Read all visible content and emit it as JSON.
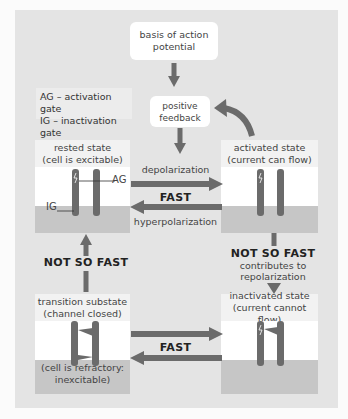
{
  "diagram": {
    "title_box": {
      "line1": "basis of action",
      "line2": "potential"
    },
    "legend": {
      "ag": "AG – activation gate",
      "ig": "IG – inactivation gate"
    },
    "feedback_box": {
      "line1": "positive",
      "line2": "feedback"
    },
    "states": {
      "rested": {
        "line1": "rested state",
        "line2": "(cell is excitable)",
        "ag_label": "AG",
        "ig_label": "IG"
      },
      "activated": {
        "line1": "activated state",
        "line2": "(current can flow)"
      },
      "transition": {
        "line1": "transition substate",
        "line2": "(channel closed)",
        "note_line1": "(cell is refractory:",
        "note_line2": "inexcitable)"
      },
      "inactivated": {
        "line1": "inactivated state",
        "line2": "(current cannot flow)"
      }
    },
    "transitions": {
      "top_forward_label": "depolarization",
      "top_speed": "FAST",
      "top_backward_label": "hyperpolarization",
      "left_speed": "NOT SO FAST",
      "right_speed": "NOT SO FAST",
      "right_note_line1": "contributes to",
      "right_note_line2": "repolarization",
      "bottom_speed": "FAST"
    },
    "colors": {
      "backdrop": "#e4e4e4",
      "arrow": "#6b6b6b",
      "membrane": "#ffffff",
      "cytoplasm": "#c6c6c6",
      "label_band": "#f2f2f2"
    }
  }
}
